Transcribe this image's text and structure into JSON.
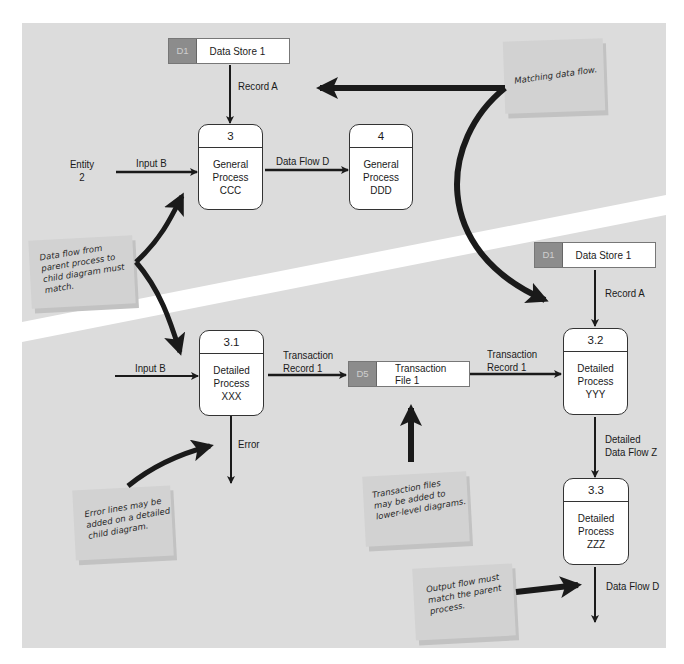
{
  "diagram": {
    "type": "data-flow-diagram",
    "colors": {
      "panel_background": "#dcdcdc",
      "diagonal_band": "#ffffff",
      "store_tag": "#8c8c8c",
      "arrow": "#1a1a1a",
      "note": "#d2d2d2"
    },
    "parent": {
      "data_store": {
        "id": "D1",
        "name": "Data Store 1"
      },
      "flow_record": "Record A",
      "entity": {
        "line1": "Entity",
        "line2": "2"
      },
      "flow_input": "Input B",
      "process_3": {
        "id": "3",
        "line1": "General",
        "line2": "Process",
        "line3": "CCC"
      },
      "flow_data": "Data Flow D",
      "process_4": {
        "id": "4",
        "line1": "General",
        "line2": "Process",
        "line3": "DDD"
      }
    },
    "child": {
      "data_store": {
        "id": "D1",
        "name": "Data Store 1"
      },
      "flow_record": "Record A",
      "flow_input": "Input B",
      "process_31": {
        "id": "3.1",
        "line1": "Detailed",
        "line2": "Process",
        "line3": "XXX"
      },
      "flow_trans_1": {
        "line1": "Transaction",
        "line2": "Record 1"
      },
      "transaction_store": {
        "id": "D5",
        "line1": "Transaction",
        "line2": "File 1"
      },
      "flow_trans_2": {
        "line1": "Transaction",
        "line2": "Record 1"
      },
      "process_32": {
        "id": "3.2",
        "line1": "Detailed",
        "line2": "Process",
        "line3": "YYY"
      },
      "flow_error": "Error",
      "flow_detailed": {
        "line1": "Detailed",
        "line2": "Data Flow Z"
      },
      "process_33": {
        "id": "3.3",
        "line1": "Detailed",
        "line2": "Process",
        "line3": "ZZZ"
      },
      "flow_output": "Data Flow D"
    },
    "notes": {
      "matching": "Matching data flow.",
      "parent_child": "Data flow from\nparent process to\nchild diagram must\nmatch.",
      "error_lines": "Error lines may be\nadded on a detailed\nchild diagram.",
      "transaction_files": "Transaction files\nmay be added to\nlower-level diagrams.",
      "output_flow": "Output flow must\nmatch the parent\nprocess."
    }
  }
}
